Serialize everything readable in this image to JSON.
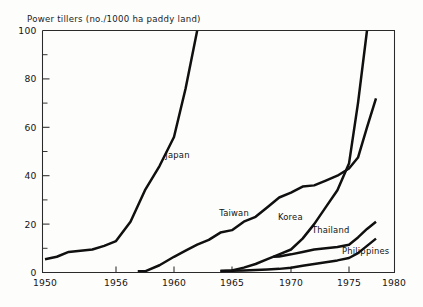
{
  "chart_data": {
    "type": "line",
    "title": "Power tillers (no./1000 ha paddy land)",
    "xlabel": "",
    "ylabel": "",
    "xlim": [
      1950,
      1980
    ],
    "ylim": [
      0,
      100
    ],
    "grid": false,
    "legend_position": "inline-labels",
    "x_ticks": [
      1950,
      1956,
      1960,
      1965,
      1970,
      1975,
      1980
    ],
    "x_tick_labels": [
      "1950",
      "1956",
      "1960",
      "1965",
      "1970",
      "1975",
      "1980"
    ],
    "y_ticks": [
      0,
      20,
      40,
      60,
      80,
      100
    ],
    "y_tick_labels": [
      "0",
      "20",
      "40",
      "60",
      "80",
      "100"
    ],
    "y_minor_ticks": [
      10,
      30,
      50,
      70,
      90
    ],
    "series": [
      {
        "name": "Japan",
        "label": "Japan",
        "label_x": 1959.4,
        "label_y": 47.5,
        "x": [
          1950,
          1951,
          1952,
          1953,
          1954,
          1955,
          1956,
          1957,
          1958,
          1959,
          1960,
          1961,
          1962
        ],
        "values": [
          5.5,
          6.5,
          8.5,
          9.0,
          9.5,
          11.0,
          13.0,
          21.0,
          34.0,
          44.0,
          56.0,
          76.0,
          100.0
        ]
      },
      {
        "name": "Taiwan",
        "label": "Taiwan",
        "label_x": 1963.9,
        "label_y": 23.5,
        "x": [
          1957.5,
          1958,
          1959,
          1960,
          1961,
          1962,
          1963,
          1964,
          1965,
          1966,
          1967,
          1968,
          1969,
          1970,
          1971,
          1972,
          1973,
          1974,
          1975,
          1976,
          1977,
          1978
        ],
        "values": [
          0.5,
          0.5,
          3.0,
          6.5,
          9.0,
          11.5,
          13.5,
          16.5,
          17.5,
          21.0,
          23.0,
          27.0,
          31.0,
          33.0,
          35.5,
          36.0,
          38.0,
          40.0,
          43.0,
          47.5,
          60.0,
          72.0
        ]
      },
      {
        "name": "Korea",
        "label": "Korea",
        "label_x": 1968.9,
        "label_y": 21.5,
        "x": [
          1964,
          1965,
          1966,
          1967,
          1968,
          1969,
          1970,
          1971,
          1972,
          1973,
          1974,
          1975,
          1976,
          1977
        ],
        "values": [
          0.6,
          0.8,
          2.0,
          3.5,
          5.5,
          7.5,
          9.5,
          14.0,
          20.0,
          27.0,
          34.0,
          45.0,
          70.0,
          100.0
        ]
      },
      {
        "name": "Thailand",
        "label": "Thailand",
        "label_x": 1971.8,
        "label_y": 16.5,
        "x": [
          1968.5,
          1969,
          1970,
          1971,
          1972,
          1973,
          1974,
          1975,
          1976,
          1977,
          1978
        ],
        "values": [
          6.5,
          6.6,
          7.5,
          8.5,
          9.5,
          10.0,
          10.5,
          11.5,
          14.5,
          18.0,
          21.0
        ]
      },
      {
        "name": "Philippines",
        "label": "Philippines",
        "label_x": 1974.4,
        "label_y": 7.8,
        "x": [
          1964,
          1965,
          1966,
          1967,
          1968,
          1969,
          1970,
          1971,
          1972,
          1973,
          1974,
          1975,
          1976,
          1977,
          1978
        ],
        "values": [
          0.6,
          0.7,
          0.8,
          1.0,
          1.2,
          1.5,
          2.0,
          2.8,
          3.5,
          4.2,
          5.0,
          6.0,
          8.0,
          11.0,
          14.0
        ]
      }
    ]
  }
}
